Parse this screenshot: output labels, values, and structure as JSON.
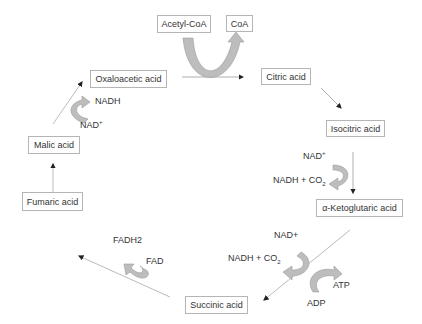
{
  "diagram": {
    "nodes": {
      "acetyl_coa": "Acetyl-CoA",
      "coa": "CoA",
      "oxaloacetic": "Oxaloacetic acid",
      "citric": "Citric acid",
      "isocitric": "Isocitric acid",
      "ketoglutaric": "α-Ketoglutaric acid",
      "succinic": "Succinic acid",
      "fumaric": "Fumaric acid",
      "malic": "Malic acid"
    },
    "cofactors": {
      "malic_in": "NAD",
      "malic_in_sup": "+",
      "malic_out": "NADH",
      "iso_in": "NAD",
      "iso_in_sup": "+",
      "iso_out": "NADH + CO",
      "iso_out_sub": "2",
      "keto_in": "NAD+",
      "keto_out": "NADH + CO",
      "keto_out_sub": "2",
      "keto_atp": "ATP",
      "keto_adp": "ADP",
      "succ_in": "FAD",
      "succ_out": "FADH2"
    },
    "colors": {
      "arrow": "#b0b0b0",
      "curve_fill": "#bdbdbd",
      "curve_stroke": "#9a9a9a",
      "box_border": "#b5b5b5",
      "text": "#333333"
    }
  }
}
